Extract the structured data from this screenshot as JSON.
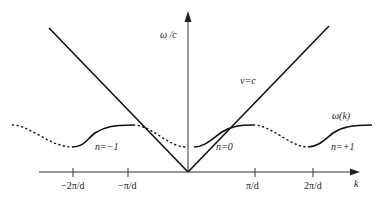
{
  "diagram": {
    "y_axis_label": "ω /c",
    "x_axis_label": "k",
    "x_ticks": [
      "−2π/d",
      "−π/d",
      "π/d",
      "2π/d"
    ],
    "light_line_label": "v=c",
    "curve_label": "ω(k)",
    "harmonic_labels": [
      "n=−1",
      "n=0",
      "n=+1"
    ],
    "colors": {
      "line": "#1a1a1a",
      "text": "#222222",
      "background": "#ffffff"
    }
  }
}
